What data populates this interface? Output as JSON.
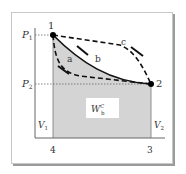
{
  "diagram": {
    "type": "pv-diagram",
    "points": [
      {
        "id": "1",
        "label": "1",
        "pressure": "P1",
        "volume": "V1"
      },
      {
        "id": "2",
        "label": "2",
        "pressure": "P2",
        "volume": "V2"
      }
    ],
    "axis_labels": {
      "p1": "P",
      "p1_sub": "1",
      "p2": "P",
      "p2_sub": "2",
      "v1": "V",
      "v1_sub": "1",
      "v2": "V",
      "v2_sub": "2"
    },
    "x_ticks": [
      "4",
      "3"
    ],
    "paths": [
      {
        "name": "a",
        "label": "a",
        "style": "dashed",
        "direction": "1 to 2"
      },
      {
        "name": "b",
        "label": "b",
        "style": "solid",
        "direction": "1 to 2"
      },
      {
        "name": "c",
        "label": "c",
        "style": "dashed",
        "direction": "1 to 2"
      }
    ],
    "work_label": {
      "main": "W",
      "sup": "C",
      "sub": "b"
    },
    "colors": {
      "shade": "#d4d4d4",
      "line": "#111111",
      "axis": "#555555",
      "frame_shadow": "#9a9a9a"
    }
  }
}
